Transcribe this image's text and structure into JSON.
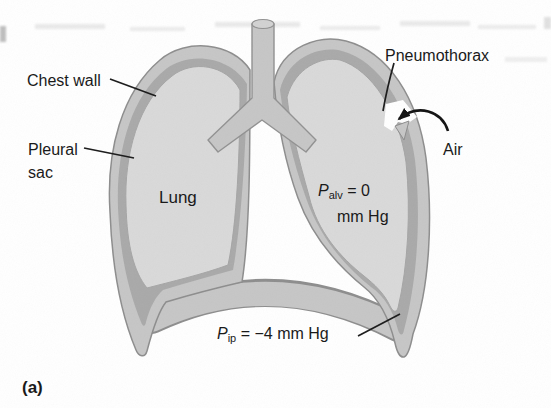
{
  "figure": {
    "caption": "(a)",
    "labels": {
      "chest_wall": "Chest wall",
      "pleural_sac": [
        "Pleural",
        "sac"
      ],
      "lung": "Lung",
      "pneumothorax": "Pneumothorax",
      "air": "Air"
    },
    "pressures": {
      "alveolar": {
        "symbol": "P",
        "subscript": "alv",
        "relation": " = 0",
        "unit": "mm Hg"
      },
      "intrapleural": {
        "symbol": "P",
        "subscript": "ip",
        "relation": " = −4 mm Hg"
      }
    },
    "colors": {
      "background": "#ffffff",
      "chest_wall": "#c6c6c6",
      "pleural_sac": "#a9a9a9",
      "lung": "#d9d9d9",
      "trachea": "#c6c6c6",
      "outline": "#8d8d8d",
      "line": "#1a1a1a"
    }
  }
}
